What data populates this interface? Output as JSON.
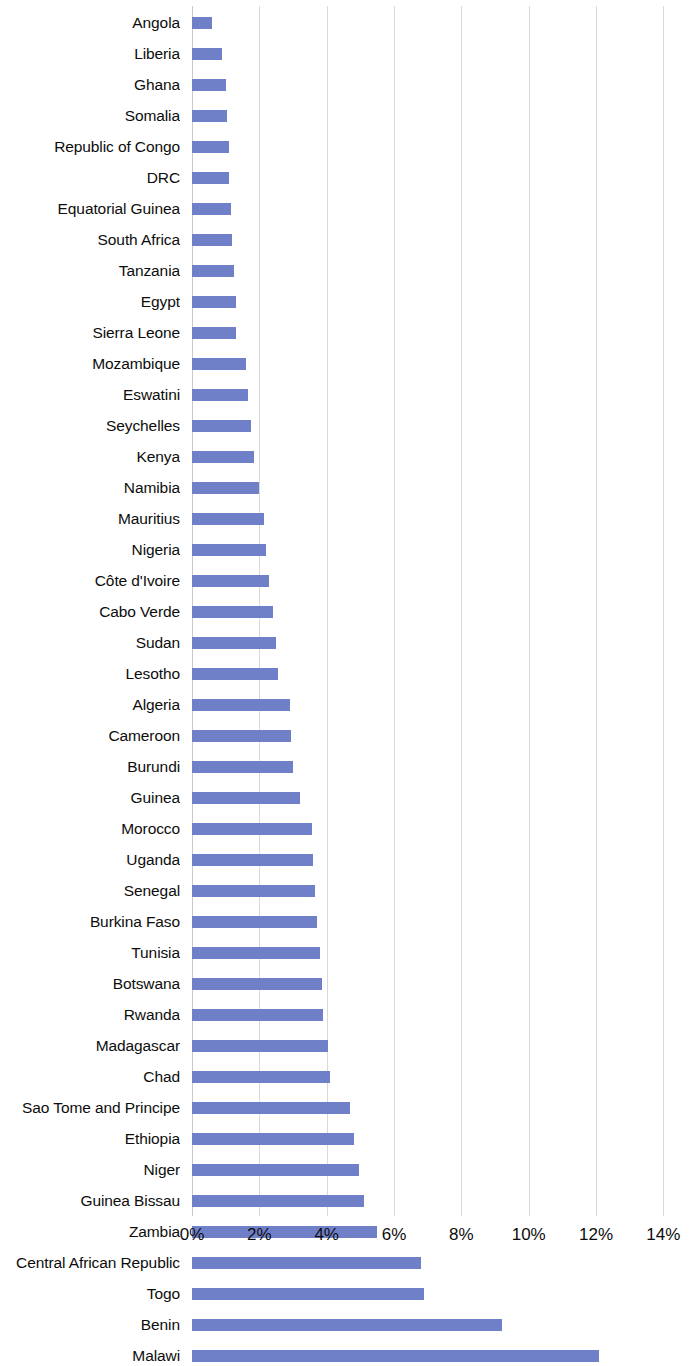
{
  "chart_data": {
    "type": "bar",
    "orientation": "horizontal",
    "title": "",
    "subtitle": "",
    "xlabel": "",
    "ylabel": "",
    "xlim": [
      0,
      14
    ],
    "x_tick_labels": [
      "0%",
      "2%",
      "4%",
      "6%",
      "8%",
      "10%",
      "12%",
      "14%"
    ],
    "x_ticks": [
      0,
      2,
      4,
      6,
      8,
      10,
      12,
      14
    ],
    "x_unit": "%",
    "grid": "vertical",
    "legend": "none",
    "series_color": "#7080c8",
    "categories": [
      "Angola",
      "Liberia",
      "Ghana",
      "Somalia",
      "Republic of Congo",
      "DRC",
      "Equatorial Guinea",
      "South Africa",
      "Tanzania",
      "Egypt",
      "Sierra Leone",
      "Mozambique",
      "Eswatini",
      "Seychelles",
      "Kenya",
      "Namibia",
      "Mauritius",
      "Nigeria",
      "Côte d'Ivoire",
      "Cabo Verde",
      "Sudan",
      "Lesotho",
      "Algeria",
      "Cameroon",
      "Burundi",
      "Guinea",
      "Morocco",
      "Uganda",
      "Senegal",
      "Burkina Faso",
      "Tunisia",
      "Botswana",
      "Rwanda",
      "Madagascar",
      "Chad",
      "Sao Tome and Principe",
      "Ethiopia",
      "Niger",
      "Guinea Bissau",
      "Zambia",
      "Central African Republic",
      "Togo",
      "Benin",
      "Malawi"
    ],
    "values": [
      0.6,
      0.9,
      1.0,
      1.05,
      1.1,
      1.1,
      1.15,
      1.2,
      1.25,
      1.3,
      1.3,
      1.6,
      1.65,
      1.75,
      1.85,
      2.0,
      2.15,
      2.2,
      2.3,
      2.4,
      2.5,
      2.55,
      2.9,
      2.95,
      3.0,
      3.2,
      3.55,
      3.6,
      3.65,
      3.7,
      3.8,
      3.85,
      3.9,
      4.05,
      4.1,
      4.7,
      4.8,
      4.95,
      5.1,
      5.5,
      6.8,
      6.9,
      9.2,
      12.1
    ]
  }
}
